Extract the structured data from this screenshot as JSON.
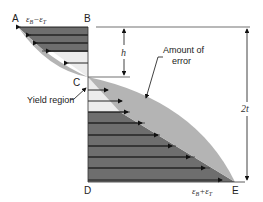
{
  "diagram": {
    "points": {
      "A": "A",
      "B": "B",
      "C": "C",
      "D": "D",
      "E": "E"
    },
    "strain_top": "ε",
    "strain_top_sub1": "B",
    "strain_top_op": "−",
    "strain_top_2": "ε",
    "strain_top_sub2": "T",
    "strain_bottom": "ε",
    "strain_bottom_sub1": "B",
    "strain_bottom_op": "+",
    "strain_bottom_2": "ε",
    "strain_bottom_sub2": "T",
    "dim_h": "h",
    "dim_2t": "2t",
    "annotation_error_line1": "Amount of",
    "annotation_error_line2": "error",
    "annotation_yield": "Yield region",
    "colors": {
      "dark_fill": "#6e6e6e",
      "error_fill": "#b4b4b4",
      "light_fill": "#ececec",
      "line": "#1a1a1a"
    }
  }
}
